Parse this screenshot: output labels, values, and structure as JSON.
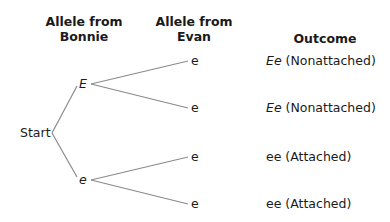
{
  "headers": {
    "bonnie_line1": "Allele from",
    "bonnie_line2": "Bonnie",
    "evan_line1": "Allele from",
    "evan_line2": "Evan",
    "outcome": "Outcome"
  },
  "tree": {
    "start": "Start",
    "bonnie_alleles": [
      "E",
      "e"
    ],
    "evan_alleles": [
      "e",
      "e",
      "e",
      "e"
    ],
    "line_color": "#8a8a8a"
  },
  "outcomes": [
    {
      "genotype_italic": "Ee",
      "phenotype": " (Nonattached)"
    },
    {
      "genotype_italic": "Ee",
      "phenotype": " (Nonattached)"
    },
    {
      "genotype": "ee",
      "phenotype": " (Attached)"
    },
    {
      "genotype": "ee",
      "phenotype": " (Attached)"
    }
  ]
}
